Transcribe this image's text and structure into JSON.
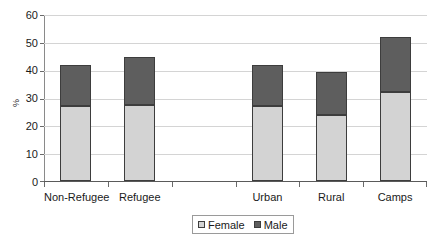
{
  "chart_data": {
    "type": "bar",
    "subtype": "stacked-bar",
    "title": "",
    "xlabel": "",
    "ylabel": "%",
    "ylim": [
      0,
      60
    ],
    "yticks": [
      0,
      10,
      20,
      30,
      40,
      50,
      60
    ],
    "ytick_labels": [
      "0",
      "10",
      "20",
      "30",
      "40",
      "50",
      "60"
    ],
    "grid": true,
    "grid_axis": "y",
    "legend_position": "bottom-center",
    "categories": [
      "Non-Refugee",
      "Refugee",
      "",
      "Urban",
      "Rural",
      "Camps"
    ],
    "series": [
      {
        "name": "Female",
        "color": "#d3d3d3",
        "values": [
          27,
          27.5,
          null,
          27,
          24,
          32
        ]
      },
      {
        "name": "Male",
        "color": "#5e5e5e",
        "values": [
          15,
          17.5,
          null,
          15,
          15.5,
          20
        ]
      }
    ],
    "totals": [
      42,
      45,
      null,
      42,
      39.5,
      52
    ]
  },
  "axis": {
    "y_title": "%",
    "y_ticks": [
      {
        "label": "60",
        "value": 60
      },
      {
        "label": "50",
        "value": 50
      },
      {
        "label": "40",
        "value": 40
      },
      {
        "label": "30",
        "value": 30
      },
      {
        "label": "20",
        "value": 20
      },
      {
        "label": "10",
        "value": 10
      },
      {
        "label": "0",
        "value": 0
      }
    ],
    "x_labels": [
      "Non-Refugee",
      "Refugee",
      "",
      "Urban",
      "Rural",
      "Camps"
    ]
  },
  "legend": {
    "items": [
      {
        "label": "Female",
        "color": "#d3d3d3"
      },
      {
        "label": "Male",
        "color": "#5e5e5e"
      }
    ]
  },
  "colors": {
    "female": "#d3d3d3",
    "male": "#5e5e5e",
    "gridline": "#d4d4d4",
    "axis": "#5a5a5a",
    "bar_border": "#3d3d3d",
    "background": "#ffffff"
  }
}
